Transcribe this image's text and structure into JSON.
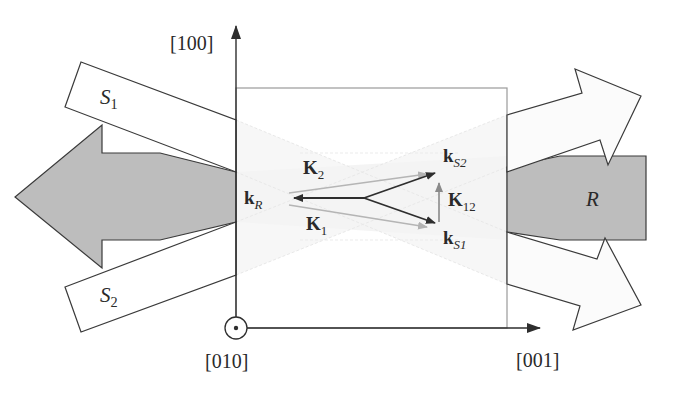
{
  "axes": {
    "vertical": {
      "label": "[100]"
    },
    "horizontal": {
      "label": "[001]"
    },
    "out_of_plane": {
      "label": "[010]",
      "symbol": "circle-dot"
    }
  },
  "beams": {
    "S1": {
      "letter": "S",
      "sub": "1"
    },
    "S2": {
      "letter": "S",
      "sub": "2"
    },
    "R": {
      "letter": "R"
    }
  },
  "vectors": {
    "kR": {
      "letter": "k",
      "sub": "R"
    },
    "kS1": {
      "letter": "k",
      "sub": "S1"
    },
    "kS2": {
      "letter": "k",
      "sub": "S2"
    },
    "K1": {
      "letter": "K",
      "sub": "1"
    },
    "K2": {
      "letter": "K",
      "sub": "2"
    },
    "K12": {
      "letter": "K",
      "sub": "12"
    }
  },
  "colors": {
    "line": "#3a3a3a",
    "gray_fill": "#bdbdbd",
    "light_arrow": "#b5b5b5",
    "crystal_edge": "#9a9a9a"
  }
}
